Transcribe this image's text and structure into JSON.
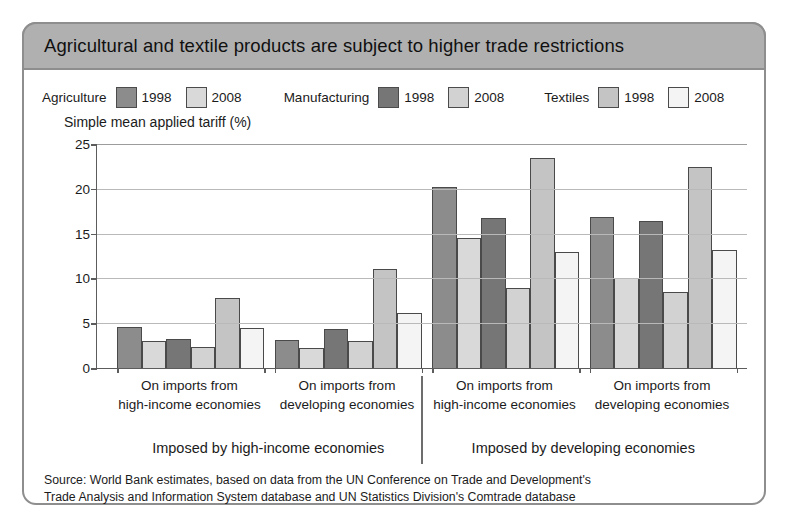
{
  "figure": {
    "title": "Agricultural and textile products are subject to higher trade restrictions",
    "source_line1": "Source: World Bank estimates, based on data from the UN Conference on Trade and Development's",
    "source_line2": "Trade Analysis and Information System database and UN Statistics Division's Comtrade database"
  },
  "legend": {
    "groups": [
      {
        "category": "Agriculture",
        "year1": "1998",
        "year2": "2008",
        "color1": "#8c8c8c",
        "color2": "#d9d9d9"
      },
      {
        "category": "Manufacturing",
        "year1": "1998",
        "year2": "2008",
        "color1": "#767676",
        "color2": "#d2d2d2"
      },
      {
        "category": "Textiles",
        "year1": "1998",
        "year2": "2008",
        "color1": "#c4c4c4",
        "color2": "#f4f4f4"
      }
    ]
  },
  "chart_data": {
    "type": "bar",
    "title": "Agricultural and textile products are subject to higher trade restrictions",
    "xlabel": "",
    "ylabel": "Simple mean applied tariff (%)",
    "ylim": [
      0,
      25
    ],
    "yticks": [
      0,
      5,
      10,
      15,
      20,
      25
    ],
    "ytick_labels": [
      "0",
      "5",
      "10",
      "15",
      "20",
      "25"
    ],
    "grid": true,
    "legend_position": "top",
    "categories": [
      "On imports from high-income economies",
      "On imports from developing economies",
      "On imports from high-income economies",
      "On imports from developing economies"
    ],
    "category_lines": [
      [
        "On imports from",
        "high-income economies"
      ],
      [
        "On imports from",
        "developing economies"
      ],
      [
        "On imports from",
        "high-income economies"
      ],
      [
        "On imports from",
        "developing economies"
      ]
    ],
    "super_categories": [
      "Imposed by high-income economies",
      "Imposed by developing economies"
    ],
    "series": [
      {
        "name": "Agriculture 1998",
        "color": "#8c8c8c",
        "values": [
          4.6,
          3.1,
          20.2,
          16.8
        ]
      },
      {
        "name": "Agriculture 2008",
        "color": "#d9d9d9",
        "values": [
          3.0,
          2.2,
          14.5,
          10.0
        ]
      },
      {
        "name": "Manufacturing 1998",
        "color": "#767676",
        "values": [
          3.2,
          4.3,
          16.7,
          16.4
        ]
      },
      {
        "name": "Manufacturing 2008",
        "color": "#d2d2d2",
        "values": [
          2.4,
          3.0,
          8.9,
          8.5
        ]
      },
      {
        "name": "Textiles 1998",
        "color": "#c4c4c4",
        "values": [
          7.8,
          11.1,
          23.4,
          22.4
        ]
      },
      {
        "name": "Textiles 2008",
        "color": "#f4f4f4",
        "values": [
          4.5,
          6.1,
          13.0,
          13.2
        ]
      }
    ]
  }
}
